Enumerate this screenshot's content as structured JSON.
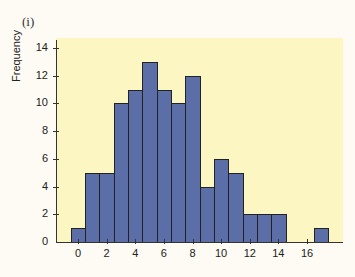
{
  "panel_label": "(i)",
  "chart_data": {
    "type": "bar",
    "title": "",
    "xlabel": "",
    "ylabel": "Frequency",
    "categories": [
      "0",
      "1",
      "2",
      "3",
      "4",
      "5",
      "6",
      "7",
      "8",
      "9",
      "10",
      "11",
      "12",
      "13",
      "14",
      "15",
      "16",
      "17"
    ],
    "values": [
      1,
      5,
      5,
      10,
      11,
      13,
      11,
      10,
      12,
      4,
      6,
      5,
      2,
      2,
      2,
      0,
      0,
      1
    ],
    "ylim": [
      0,
      14
    ],
    "yticks": [
      0,
      2,
      4,
      6,
      8,
      10,
      12,
      14
    ],
    "xticks": [
      0,
      2,
      4,
      6,
      8,
      10,
      12,
      14,
      16
    ],
    "grid": false,
    "legend": null,
    "colors": {
      "bar": "#5b6ea8",
      "plot_background": "#fbf6c2",
      "edge": "#222222"
    }
  }
}
